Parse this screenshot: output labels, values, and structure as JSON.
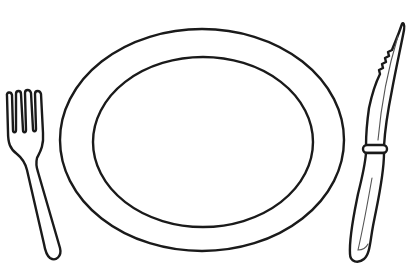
{
  "scene": {
    "description": "Black and white line drawing of a place setting",
    "background_color": "#ffffff",
    "line_color": "#1a1a1a",
    "objects": [
      {
        "name": "fork",
        "position": "left"
      },
      {
        "name": "plate",
        "position": "center",
        "shape": "oval with inner rim"
      },
      {
        "name": "knife",
        "position": "right",
        "feature": "serrated blade with bolster ring"
      }
    ]
  }
}
